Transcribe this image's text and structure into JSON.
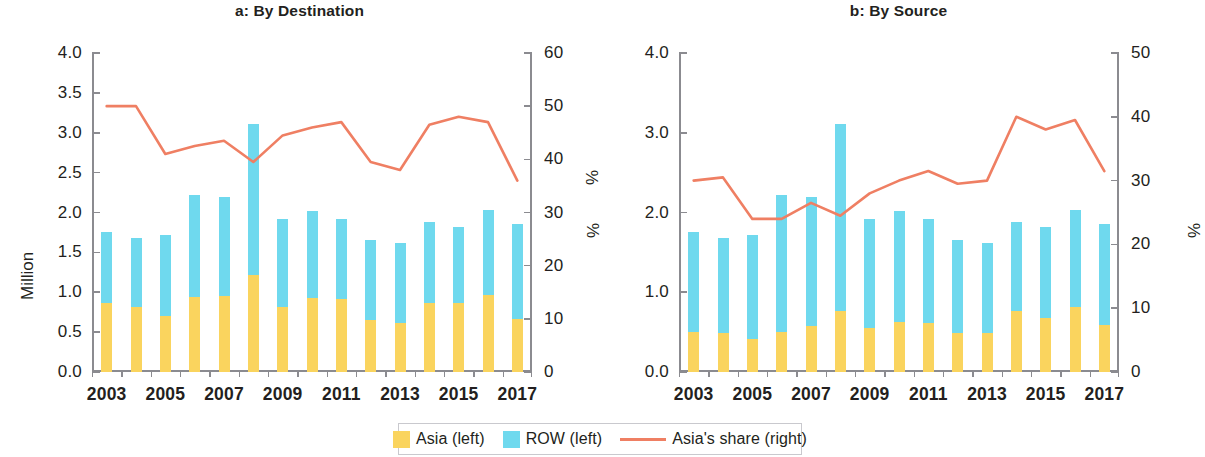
{
  "figure": {
    "title": "",
    "colors": {
      "asia": "#fad45e",
      "row": "#6fd9ee",
      "share_line": "#ef7f63",
      "axis": "#8b8b90",
      "text": "#231f20"
    }
  },
  "legend": {
    "items": [
      {
        "name": "asia",
        "label": "Asia (left)",
        "marker": "square",
        "color": "#fad45e"
      },
      {
        "name": "row",
        "label": "ROW  (left)",
        "marker": "square",
        "color": "#6fd9ee"
      },
      {
        "name": "share",
        "label": "Asia's share (right)",
        "marker": "line",
        "color": "#ef7f63"
      }
    ]
  },
  "panels": [
    {
      "id": "a",
      "title": "a: By Destination",
      "left_axis_label": "Million",
      "right_axis_label": "%",
      "left_ticks": [
        "0.0",
        "0.5",
        "1.0",
        "1.5",
        "2.0",
        "2.5",
        "3.0",
        "3.5",
        "4.0"
      ],
      "right_ticks": [
        "0",
        "10",
        "20",
        "30",
        "40",
        "50",
        "60"
      ],
      "x_ticks": [
        "2003",
        "2005",
        "2007",
        "2009",
        "2011",
        "2013",
        "2015",
        "2017"
      ]
    },
    {
      "id": "b",
      "title": "b: By Source",
      "left_axis_label": "",
      "right_axis_label": "%",
      "left_ticks": [
        "0.0",
        "1.0",
        "2.0",
        "3.0",
        "4.0"
      ],
      "right_ticks": [
        "0",
        "10",
        "20",
        "30",
        "40",
        "50"
      ],
      "x_ticks": [
        "2003",
        "2005",
        "2007",
        "2009",
        "2011",
        "2013",
        "2015",
        "2017"
      ]
    }
  ],
  "chart_data": [
    {
      "type": "bar",
      "id": "a",
      "title": "a: By Destination",
      "xlabel": "",
      "ylabel": "Million",
      "y2label": "%",
      "ylim": [
        0,
        4.0
      ],
      "y2lim": [
        0,
        60
      ],
      "grid": false,
      "legend_position": "bottom",
      "stacked": true,
      "categories": [
        2003,
        2004,
        2005,
        2006,
        2007,
        2008,
        2009,
        2010,
        2011,
        2012,
        2013,
        2014,
        2015,
        2016,
        2017
      ],
      "series": [
        {
          "name": "Asia (left)",
          "axis": "left",
          "type": "bar",
          "color": "#fad45e",
          "values": [
            0.87,
            0.82,
            0.7,
            0.94,
            0.95,
            1.22,
            0.81,
            0.93,
            0.92,
            0.65,
            0.61,
            0.87,
            0.87,
            0.97,
            0.66
          ]
        },
        {
          "name": "ROW (left)",
          "axis": "left",
          "type": "bar",
          "color": "#6fd9ee",
          "values": [
            0.89,
            0.86,
            1.02,
            1.28,
            1.24,
            1.89,
            1.11,
            1.09,
            1.0,
            1.01,
            1.01,
            1.01,
            0.95,
            1.06,
            1.2
          ]
        },
        {
          "name": "Total (left)",
          "axis": "left",
          "type": "bar-total",
          "values": [
            1.76,
            1.68,
            1.72,
            2.22,
            2.19,
            3.11,
            1.92,
            2.02,
            1.92,
            1.66,
            1.62,
            1.88,
            1.82,
            2.03,
            1.86
          ]
        },
        {
          "name": "Asia's share (right)",
          "axis": "right",
          "type": "line",
          "color": "#ef7f63",
          "values": [
            50.0,
            50.0,
            41.0,
            42.5,
            43.5,
            39.5,
            44.5,
            46.0,
            47.0,
            39.5,
            38.0,
            46.5,
            48.0,
            47.0,
            36.0
          ]
        }
      ]
    },
    {
      "type": "bar",
      "id": "b",
      "title": "b: By Source",
      "xlabel": "",
      "ylabel": "",
      "y2label": "%",
      "ylim": [
        0,
        4.0
      ],
      "y2lim": [
        0,
        50
      ],
      "grid": false,
      "legend_position": "bottom",
      "stacked": true,
      "categories": [
        2003,
        2004,
        2005,
        2006,
        2007,
        2008,
        2009,
        2010,
        2011,
        2012,
        2013,
        2014,
        2015,
        2016,
        2017
      ],
      "series": [
        {
          "name": "Asia (left)",
          "axis": "left",
          "type": "bar",
          "color": "#fad45e",
          "values": [
            0.5,
            0.49,
            0.41,
            0.5,
            0.58,
            0.77,
            0.55,
            0.63,
            0.61,
            0.49,
            0.49,
            0.77,
            0.68,
            0.81,
            0.59
          ]
        },
        {
          "name": "ROW (left)",
          "axis": "left",
          "type": "bar",
          "color": "#6fd9ee",
          "values": [
            1.26,
            1.19,
            1.31,
            1.72,
            1.61,
            2.34,
            1.37,
            1.39,
            1.31,
            1.17,
            1.13,
            1.11,
            1.14,
            1.22,
            1.27
          ]
        },
        {
          "name": "Total (left)",
          "axis": "left",
          "type": "bar-total",
          "values": [
            1.76,
            1.68,
            1.72,
            2.22,
            2.19,
            3.11,
            1.92,
            2.02,
            1.92,
            1.66,
            1.62,
            1.88,
            1.82,
            2.03,
            1.86
          ]
        },
        {
          "name": "Asia's share (right)",
          "axis": "right",
          "type": "line",
          "color": "#ef7f63",
          "values": [
            30.0,
            30.5,
            24.0,
            24.0,
            26.5,
            24.5,
            28.0,
            30.0,
            31.5,
            29.5,
            30.0,
            40.0,
            38.0,
            39.5,
            31.5
          ]
        }
      ]
    }
  ]
}
